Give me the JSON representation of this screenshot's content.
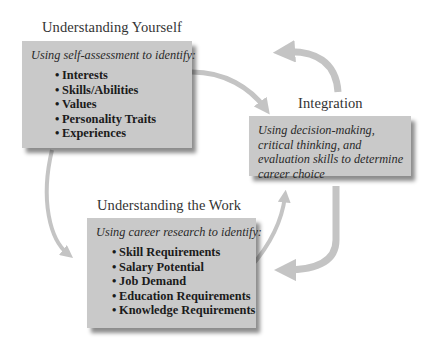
{
  "colors": {
    "box_fill": "#c9c9c9",
    "arrow": "#c4c4c4",
    "text": "#1b1b1b"
  },
  "nodes": {
    "yourself": {
      "title": "Understanding Yourself",
      "lead": "Using self-assessment to identify:",
      "items": [
        "Interests",
        "Skills/Abilities",
        "Values",
        "Personality Traits",
        "Experiences"
      ]
    },
    "integration": {
      "title": "Integration",
      "lead": "Using decision-making, critical thinking, and evaluation skills to determine career choice"
    },
    "work": {
      "title": "Understanding the Work",
      "lead": "Using career research to identify:",
      "items": [
        "Skill Requirements",
        "Salary Potential",
        "Job Demand",
        "Education Requirements",
        "Knowledge Requirements"
      ]
    }
  },
  "bullet": "•",
  "edges": [
    {
      "from": "yourself",
      "to": "integration"
    },
    {
      "from": "yourself",
      "to": "work"
    },
    {
      "from": "work",
      "to": "integration"
    },
    {
      "from": "integration",
      "to": "work"
    },
    {
      "from": "integration",
      "to": "yourself"
    }
  ]
}
